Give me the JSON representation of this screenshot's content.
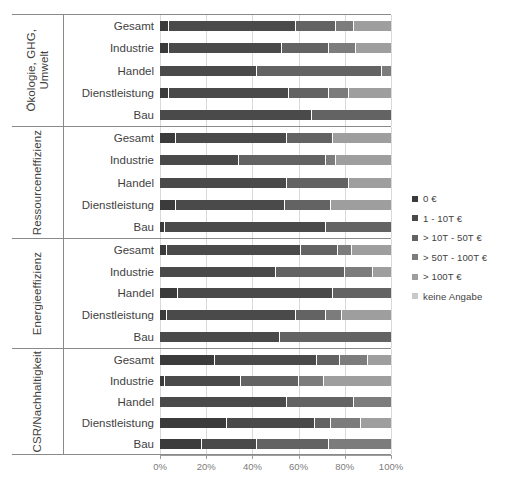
{
  "chart_data": {
    "type": "bar",
    "orientation": "horizontal",
    "stacked": true,
    "stacked_mode": "percent",
    "title": "",
    "xlabel": "",
    "ylabel": "",
    "xlim": [
      0,
      100
    ],
    "xticks": [
      0,
      20,
      40,
      60,
      80,
      100
    ],
    "xtick_labels": [
      "0%",
      "20%",
      "40%",
      "60%",
      "80%",
      "100%"
    ],
    "grid": true,
    "grid_axis": "x",
    "legend_position": "right",
    "series_names": [
      "0 €",
      "1 - 10T €",
      "> 10T - 50T €",
      "> 50T - 100T €",
      "> 100T €",
      "keine Angabe"
    ],
    "series_colors": [
      "#3b3b3b",
      "#4a4a4a",
      "#636363",
      "#7c7c7c",
      "#9e9e9e",
      "#c9c9c9"
    ],
    "categories": [
      "Gesamt",
      "Industrie",
      "Handel",
      "Dienstleistung",
      "Bau"
    ],
    "groups": [
      {
        "name": "Ökologie, GHG,\nUmwelt",
        "rows": [
          {
            "label": "Gesamt",
            "values": [
              4,
              55,
              17,
              8,
              16,
              0
            ]
          },
          {
            "label": "Industrie",
            "values": [
              4,
              49,
              20,
              12,
              15,
              0
            ]
          },
          {
            "label": "Handel",
            "values": [
              0,
              42,
              54,
              4,
              0,
              0
            ]
          },
          {
            "label": "Dienstleistung",
            "values": [
              4,
              52,
              17,
              9,
              18,
              0
            ]
          },
          {
            "label": "Bau",
            "values": [
              0,
              66,
              34,
              0,
              0,
              0
            ]
          }
        ]
      },
      {
        "name": "Ressourceneffizienz",
        "rows": [
          {
            "label": "Gesamt",
            "values": [
              7,
              48,
              20,
              0,
              25,
              0
            ]
          },
          {
            "label": "Industrie",
            "values": [
              0,
              34,
              38,
              4,
              24,
              0
            ]
          },
          {
            "label": "Handel",
            "values": [
              0,
              55,
              27,
              0,
              18,
              0
            ]
          },
          {
            "label": "Dienstleistung",
            "values": [
              7,
              47,
              20,
              0,
              26,
              0
            ]
          },
          {
            "label": "Bau",
            "values": [
              2,
              70,
              28,
              0,
              0,
              0
            ]
          }
        ]
      },
      {
        "name": "Energieeffizienz",
        "rows": [
          {
            "label": "Gesamt",
            "values": [
              3,
              58,
              16,
              6,
              17,
              0
            ]
          },
          {
            "label": "Industrie",
            "values": [
              0,
              50,
              30,
              12,
              8,
              0
            ]
          },
          {
            "label": "Handel",
            "values": [
              8,
              67,
              25,
              0,
              0,
              0
            ]
          },
          {
            "label": "Dienstleistung",
            "values": [
              3,
              56,
              13,
              7,
              21,
              0
            ]
          },
          {
            "label": "Bau",
            "values": [
              0,
              52,
              48,
              0,
              0,
              0
            ]
          }
        ]
      },
      {
        "name": "CSR/Nachhaltigkeit",
        "rows": [
          {
            "label": "Gesamt",
            "values": [
              24,
              44,
              10,
              12,
              10,
              0
            ]
          },
          {
            "label": "Industrie",
            "values": [
              2,
              33,
              25,
              11,
              29,
              0
            ]
          },
          {
            "label": "Handel",
            "values": [
              0,
              55,
              29,
              16,
              0,
              0
            ]
          },
          {
            "label": "Dienstleistung",
            "values": [
              29,
              38,
              7,
              13,
              13,
              0
            ]
          },
          {
            "label": "Bau",
            "values": [
              18,
              24,
              31,
              27,
              0,
              0
            ]
          }
        ]
      }
    ]
  },
  "legend": {
    "items": [
      {
        "label": "0 €",
        "color": "#3b3b3b"
      },
      {
        "label": "1 - 10T €",
        "color": "#4a4a4a"
      },
      {
        "label": "> 10T - 50T €",
        "color": "#636363"
      },
      {
        "label": "> 50T - 100T €",
        "color": "#7c7c7c"
      },
      {
        "label": "> 100T €",
        "color": "#9e9e9e"
      },
      {
        "label": "keine Angabe",
        "color": "#c9c9c9"
      }
    ]
  }
}
